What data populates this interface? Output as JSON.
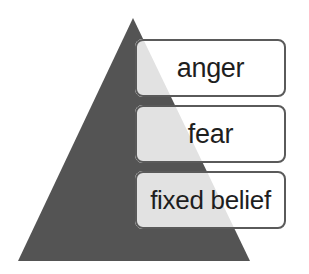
{
  "diagram": {
    "type": "pyramid",
    "colors": {
      "pyramid_fill": "#545454",
      "box_overlay": "#e4e4e4",
      "box_border": "#5a5a5a",
      "text": "#1e1e1e"
    },
    "levels": [
      {
        "label": "anger"
      },
      {
        "label": "fear"
      },
      {
        "label": "fixed belief"
      }
    ]
  }
}
